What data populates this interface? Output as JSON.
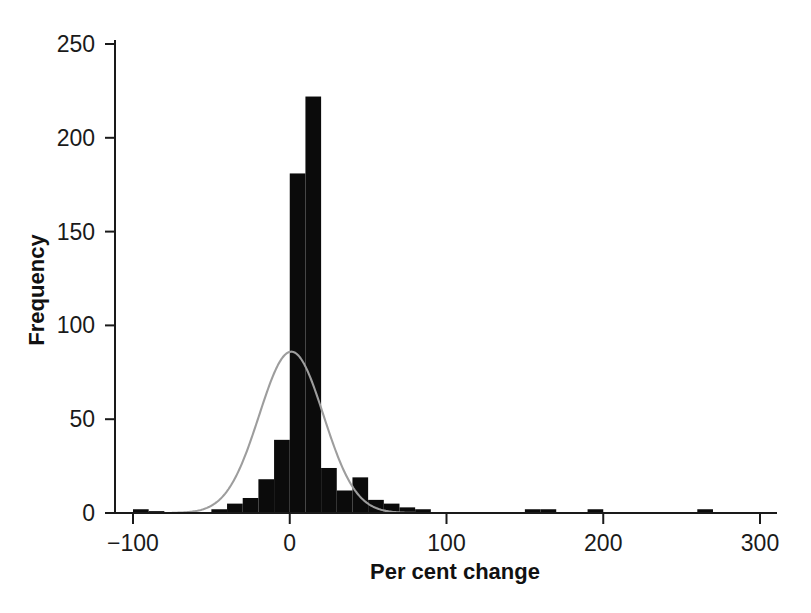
{
  "chart_data": {
    "type": "bar",
    "title": "",
    "subtitle": "",
    "xlabel": "Per cent change",
    "ylabel": "Frequency",
    "xlim": [
      -110,
      310
    ],
    "ylim": [
      0,
      258
    ],
    "xticks": [
      -100,
      0,
      100,
      200,
      300
    ],
    "xtick_labels": [
      "−100",
      "0",
      "100",
      "200",
      "300"
    ],
    "yticks": [
      0,
      50,
      100,
      150,
      200,
      250
    ],
    "ytick_labels": [
      "0",
      "50",
      "100",
      "150",
      "200",
      "250"
    ],
    "grid": false,
    "legend": "none",
    "bin_width": 10,
    "bin_starts": [
      -100,
      -90,
      -80,
      -70,
      -60,
      -50,
      -40,
      -30,
      -20,
      -10,
      0,
      10,
      20,
      30,
      40,
      50,
      60,
      70,
      80,
      90,
      100,
      110,
      120,
      130,
      140,
      150,
      160,
      170,
      180,
      190,
      200,
      210,
      220,
      230,
      240,
      250,
      260,
      270,
      280,
      290
    ],
    "bin_centers": [
      -95,
      -85,
      -75,
      -65,
      -55,
      -45,
      -35,
      -25,
      -15,
      -5,
      5,
      15,
      25,
      35,
      45,
      55,
      65,
      75,
      85,
      95,
      105,
      115,
      125,
      135,
      145,
      155,
      165,
      175,
      185,
      195,
      205,
      215,
      225,
      235,
      245,
      255,
      265,
      275,
      285,
      295
    ],
    "values": [
      2,
      1,
      0,
      0,
      0,
      2,
      5,
      8,
      18,
      39,
      181,
      222,
      24,
      12,
      19,
      7,
      5,
      3,
      2,
      0,
      0,
      0,
      0,
      0,
      0,
      2,
      2,
      0,
      0,
      2,
      0,
      0,
      0,
      0,
      0,
      0,
      2,
      0,
      0,
      0
    ],
    "bars_color": "#0b0b0b",
    "overlay": {
      "type": "normal-curve",
      "name": "Normal distribution fit",
      "color": "#9d9d9d",
      "mean": 1.0,
      "sd": 20.5,
      "peak_frequency": 86
    }
  },
  "figure": {
    "background_color": "#ffffff",
    "axis_color": "#1a1a1a"
  }
}
